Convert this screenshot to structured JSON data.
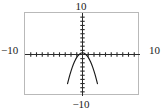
{
  "figure": {
    "kind": "graphing-calculator-viewport",
    "background_color": "#ffffff",
    "frame_color": "#b9b9b9",
    "axis_color": "#2b2b2b",
    "curve_color": "#1a1a1a"
  },
  "labels": {
    "top": "10",
    "bottom": "−10",
    "left": "−10",
    "right": "10"
  },
  "chart_data": {
    "type": "line",
    "title": "",
    "xlabel": "",
    "ylabel": "",
    "xlim": [
      -10,
      10
    ],
    "ylim": [
      -10,
      10
    ],
    "grid": false,
    "legend": null,
    "axis_ticks": {
      "x_tick_step": 1,
      "y_tick_step": 1,
      "x_tick_values": [
        -9,
        -8,
        -7,
        -6,
        -5,
        -4,
        -3,
        -2,
        -1,
        1,
        2,
        3,
        4,
        5,
        6,
        7,
        8,
        9
      ],
      "y_tick_values": [
        -9,
        -8,
        -7,
        -6,
        -5,
        -4,
        -3,
        -2,
        -1,
        1,
        2,
        3,
        4,
        5,
        6,
        7,
        8,
        9
      ]
    },
    "tick_labels": {
      "x": [
        "−10",
        "10"
      ],
      "y": [
        "−10",
        "10"
      ]
    },
    "series": [
      {
        "name": "downward parabola",
        "equation": "y = 0.4 - 1.1x^2",
        "vertex": [
          0,
          0.4
        ],
        "opens": "down",
        "x": [
          -2.6,
          -2.4,
          -2.2,
          -2.0,
          -1.8,
          -1.6,
          -1.4,
          -1.2,
          -1.0,
          -0.8,
          -0.6,
          -0.4,
          -0.2,
          0.0,
          0.2,
          0.4,
          0.6,
          0.8,
          1.0,
          1.2,
          1.4,
          1.6,
          1.8,
          2.0,
          2.2,
          2.4,
          2.6
        ],
        "y": [
          -7.04,
          -5.94,
          -4.92,
          -4.0,
          -3.16,
          -2.42,
          -1.76,
          -1.18,
          -0.7,
          -0.3,
          0.0,
          0.22,
          0.36,
          0.4,
          0.36,
          0.22,
          0.0,
          -0.3,
          -0.7,
          -1.18,
          -1.76,
          -2.42,
          -3.16,
          -4.0,
          -4.92,
          -5.94,
          -7.04
        ]
      }
    ]
  }
}
